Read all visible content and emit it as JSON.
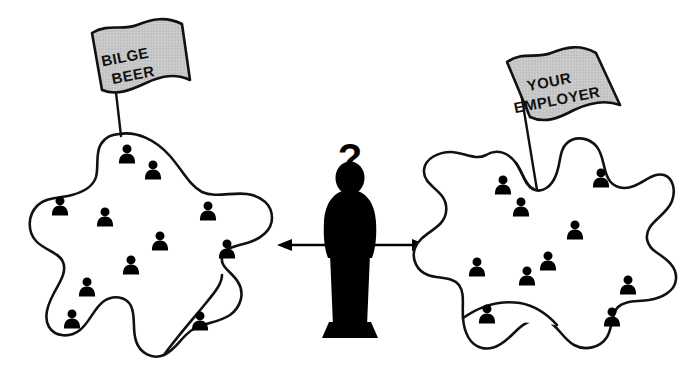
{
  "illustration": {
    "title": "Employer choice comparison illustration",
    "background_color": "#ffffff",
    "line_color": "#111111",
    "flag_fill_color": "#c8c8c8",
    "silhouette_color": "#000000"
  },
  "left_group": {
    "flag_label_line1": "BILGE",
    "flag_label_line2": "BEER",
    "people_count": 11,
    "people": [
      {
        "x": 127,
        "y": 155
      },
      {
        "x": 153,
        "y": 171
      },
      {
        "x": 60,
        "y": 207
      },
      {
        "x": 105,
        "y": 218
      },
      {
        "x": 208,
        "y": 212
      },
      {
        "x": 160,
        "y": 242
      },
      {
        "x": 227,
        "y": 250
      },
      {
        "x": 131,
        "y": 266
      },
      {
        "x": 87,
        "y": 288
      },
      {
        "x": 72,
        "y": 320
      },
      {
        "x": 200,
        "y": 322
      }
    ]
  },
  "right_group": {
    "flag_label_line1": "YOUR",
    "flag_label_line2": "EMPLOYER",
    "people_count": 10,
    "people": [
      {
        "x": 503,
        "y": 186
      },
      {
        "x": 601,
        "y": 179
      },
      {
        "x": 521,
        "y": 208
      },
      {
        "x": 575,
        "y": 231
      },
      {
        "x": 477,
        "y": 268
      },
      {
        "x": 548,
        "y": 262
      },
      {
        "x": 527,
        "y": 277
      },
      {
        "x": 628,
        "y": 286
      },
      {
        "x": 487,
        "y": 315
      },
      {
        "x": 612,
        "y": 318
      }
    ]
  },
  "center": {
    "question_mark": "?",
    "left_arrow_icon": "arrow-left-icon",
    "right_arrow_icon": "arrow-right-icon",
    "person_silhouette_icon": "person-silhouette-icon"
  }
}
